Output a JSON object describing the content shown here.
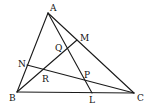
{
  "diagram": {
    "type": "geometry",
    "points": {
      "A": {
        "label": "A",
        "x": 48,
        "y": 13
      },
      "B": {
        "label": "B",
        "x": 17,
        "y": 92
      },
      "C": {
        "label": "C",
        "x": 134,
        "y": 93
      },
      "M": {
        "label": "M",
        "x": 77,
        "y": 40
      },
      "N": {
        "label": "N",
        "x": 27,
        "y": 65
      },
      "L": {
        "label": "L",
        "x": 92,
        "y": 93
      },
      "Q": {
        "label": "Q",
        "x": 66,
        "y": 50
      },
      "R": {
        "label": "R",
        "x": 43,
        "y": 70
      },
      "P": {
        "label": "P",
        "x": 84,
        "y": 79
      }
    },
    "segments": [
      {
        "from": "A",
        "to": "B"
      },
      {
        "from": "B",
        "to": "C"
      },
      {
        "from": "C",
        "to": "A"
      },
      {
        "from": "A",
        "to": "L"
      },
      {
        "from": "B",
        "to": "M"
      },
      {
        "from": "N",
        "to": "C"
      }
    ],
    "labels": {
      "A": "A",
      "B": "B",
      "C": "C",
      "M": "M",
      "N": "N",
      "L": "L",
      "Q": "Q",
      "R": "R",
      "P": "P"
    }
  }
}
